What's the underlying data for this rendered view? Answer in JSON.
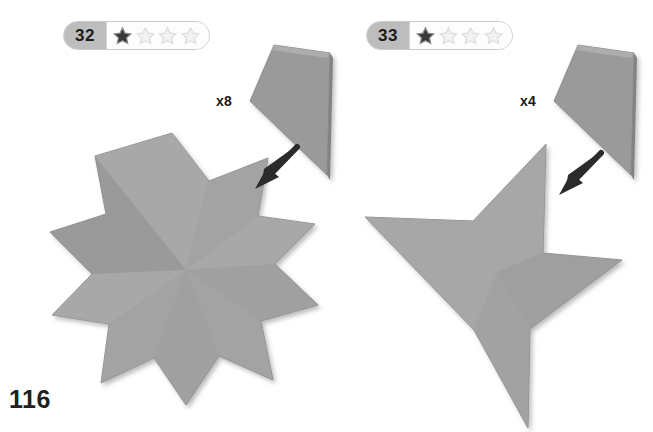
{
  "page": {
    "number": "116",
    "background_color": "#ffffff",
    "width": 653,
    "height": 432
  },
  "palette": {
    "shape_fill": "#9a9a9a",
    "shape_fill_light": "#a8a8a8",
    "shape_edge_dark": "#8a8a8a",
    "shape_shadow": "#c8c8c8",
    "arrow_color": "#2b2b2b",
    "badge_number_bg": "#bdbdbd",
    "badge_border": "#c9c9c9",
    "star_filled": "#3a3a3a",
    "star_empty": "#ededed",
    "text_color": "#1b1b1b"
  },
  "models": [
    {
      "id": "model-32",
      "badge": {
        "number": "32",
        "rating_filled": 1,
        "rating_total": 4,
        "star_icon_name": "difficulty-star-icon"
      },
      "multiplier": "x8",
      "unit_shape": "kite-quadrilateral",
      "assembly_shape": "eight-pointed-star",
      "arrow_icon_name": "assembly-arrow-icon"
    },
    {
      "id": "model-33",
      "badge": {
        "number": "33",
        "rating_filled": 1,
        "rating_total": 4,
        "star_icon_name": "difficulty-star-icon"
      },
      "multiplier": "x4",
      "unit_shape": "kite-quadrilateral",
      "assembly_shape": "four-pointed-pinwheel-star",
      "arrow_icon_name": "assembly-arrow-icon"
    }
  ]
}
